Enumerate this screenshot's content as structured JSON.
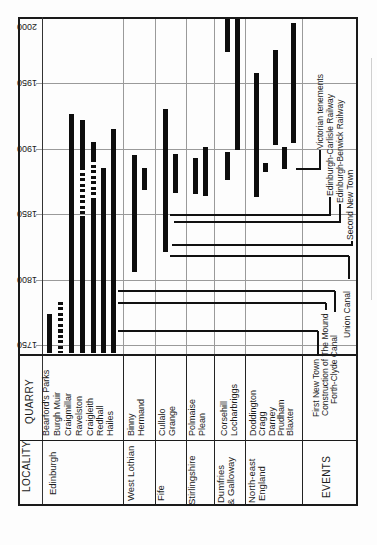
{
  "table": {
    "quarry_header": "QUARRY",
    "locality_header": "LOCALITY"
  },
  "chart_data": {
    "type": "gantt-timeline",
    "title": "",
    "orientation": "figure printed rotated 90 deg: time axis vertical, 1750 at bottom to 2000 at top; year labels appear upside down; category labels read bottom-to-top",
    "time_axis": {
      "unit": "year",
      "ticks": [
        2000,
        1950,
        1900,
        1850,
        1800,
        1750
      ],
      "range": [
        1744,
        2000
      ]
    },
    "colors": {
      "bar": "#0d0d0d",
      "grid": "#9a9a9a",
      "frame": "#1a1a1a",
      "event_line": "#111111"
    },
    "layout": {
      "frame": {
        "left": 18,
        "top": 17,
        "right": 356,
        "plot_bottom": 345,
        "table_top": 354,
        "row_divider": 440,
        "table_bottom": 504
      },
      "axis_col_x": 42,
      "scale": {
        "y_at_1750": 345,
        "base_year": 1750,
        "px_per_year": 1.31
      },
      "quarry_label_anchor_y": 436,
      "locality_label_anchor_y": 501
    },
    "groups": [
      {
        "locality": "Edinburgh",
        "divider_x": 123,
        "label_lines": [
          {
            "text": "Edinburgh",
            "x": 53,
            "top": 495
          }
        ],
        "quarries": [
          {
            "name": "Bearford's Parks",
            "x": 49,
            "segments": [
              {
                "start": 1744,
                "end": 1774,
                "style": "solid"
              }
            ]
          },
          {
            "name": "Burgh Muir",
            "x": 60,
            "segments": [
              {
                "start": 1744,
                "end": 1783,
                "style": "dashed"
              }
            ]
          },
          {
            "name": "Craigmillar",
            "x": 71,
            "segments": [
              {
                "start": 1744,
                "end": 1926,
                "style": "solid"
              }
            ]
          },
          {
            "name": "Ravelston",
            "x": 82,
            "segments": [
              {
                "start": 1744,
                "end": 1846,
                "style": "solid"
              },
              {
                "start": 1846,
                "end": 1886,
                "style": "dashed"
              },
              {
                "start": 1886,
                "end": 1922,
                "style": "solid"
              }
            ]
          },
          {
            "name": "Craigleith",
            "x": 93,
            "segments": [
              {
                "start": 1744,
                "end": 1861,
                "style": "solid"
              },
              {
                "start": 1861,
                "end": 1892,
                "style": "dashed"
              },
              {
                "start": 1892,
                "end": 1905,
                "style": "solid"
              }
            ]
          },
          {
            "name": "Redhall",
            "x": 103,
            "segments": [
              {
                "start": 1744,
                "end": 1885,
                "style": "solid"
              }
            ]
          },
          {
            "name": "Hailes",
            "x": 113,
            "segments": [
              {
                "start": 1744,
                "end": 1915,
                "style": "solid"
              }
            ]
          }
        ]
      },
      {
        "locality": "West Lothian",
        "divider_x": 155,
        "label_lines": [
          {
            "text": "West Lothian",
            "x": 131,
            "top": 501
          }
        ],
        "quarries": [
          {
            "name": "Binny",
            "x": 134,
            "segments": [
              {
                "start": 1806,
                "end": 1895,
                "style": "solid"
              }
            ]
          },
          {
            "name": "Hermand",
            "x": 144,
            "segments": [
              {
                "start": 1868,
                "end": 1885,
                "style": "solid"
              }
            ]
          }
        ]
      },
      {
        "locality": "Fife",
        "divider_x": 186,
        "label_lines": [
          {
            "text": "Fife",
            "x": 161,
            "top": 501
          }
        ],
        "quarries": [
          {
            "name": "Cullalo",
            "x": 165,
            "segments": [
              {
                "start": 1821,
                "end": 1930,
                "style": "solid"
              }
            ]
          },
          {
            "name": "Grange",
            "x": 175,
            "segments": [
              {
                "start": 1866,
                "end": 1896,
                "style": "solid"
              }
            ]
          }
        ]
      },
      {
        "locality": "Stirlingshire",
        "divider_x": 214,
        "label_lines": [
          {
            "text": "Stirlingshire",
            "x": 192,
            "top": 505
          }
        ],
        "quarries": [
          {
            "name": "Polmaise",
            "x": 195,
            "segments": [
              {
                "start": 1865,
                "end": 1893,
                "style": "solid"
              }
            ]
          },
          {
            "name": "Plean",
            "x": 205,
            "segments": [
              {
                "start": 1864,
                "end": 1901,
                "style": "solid"
              }
            ]
          }
        ]
      },
      {
        "locality": "Dumfries & Galloway",
        "divider_x": 245,
        "label_lines": [
          {
            "text": "Dumfries",
            "x": 221,
            "top": 503
          },
          {
            "text": "& Galloway",
            "x": 231,
            "top": 505
          }
        ],
        "quarries": [
          {
            "name": "Corsehill",
            "x": 227,
            "segments": [
              {
                "start": 1876,
                "end": 1897,
                "style": "solid"
              },
              {
                "start": 1974,
                "end": 1999,
                "style": "solid"
              }
            ]
          },
          {
            "name": "Locharbriggs",
            "x": 237,
            "segments": [
              {
                "start": 1899,
                "end": 1999,
                "style": "solid"
              }
            ]
          }
        ]
      },
      {
        "locality": "North-east England",
        "divider_x": 302,
        "label_lines": [
          {
            "text": "North-east",
            "x": 252,
            "top": 503
          },
          {
            "text": "England",
            "x": 262,
            "top": 501
          }
        ],
        "quarries": [
          {
            "name": "Doddington",
            "x": 256,
            "segments": [
              {
                "start": 1863,
                "end": 1958,
                "style": "solid"
              }
            ]
          },
          {
            "name": "Cragg",
            "x": 265,
            "segments": [
              {
                "start": 1882,
                "end": 1889,
                "style": "solid"
              }
            ]
          },
          {
            "name": "Darney",
            "x": 275,
            "segments": [
              {
                "start": 1903,
                "end": 1975,
                "style": "solid"
              }
            ]
          },
          {
            "name": "Prudham",
            "x": 284,
            "segments": [
              {
                "start": 1884,
                "end": 1901,
                "style": "solid"
              }
            ]
          },
          {
            "name": "Blaxter",
            "x": 293,
            "segments": [
              {
                "start": 1904,
                "end": 1996,
                "style": "solid"
              }
            ]
          }
        ]
      }
    ],
    "events": {
      "header": "EVENTS",
      "items": [
        {
          "name": "First New Town",
          "year": 1761,
          "line": {
            "x1": 118,
            "x2": 318
          },
          "stub": {
            "x": 317,
            "y1": 331,
            "y2": 356
          },
          "label": {
            "x": 317,
            "top": 417
          }
        },
        {
          "name": "Construction of The Mound",
          "year": 1782,
          "line": {
            "x1": 118,
            "x2": 326
          },
          "stub": {
            "x": 325,
            "y1": 303,
            "y2": 310
          },
          "label": {
            "x": 326,
            "top": 416
          }
        },
        {
          "name": "Forth-Clyde Canal",
          "year": 1791,
          "line": {
            "x1": 118,
            "x2": 335
          },
          "stub": {
            "x": 334,
            "y1": 291,
            "y2": 312
          },
          "label": {
            "x": 335,
            "top": 404
          }
        },
        {
          "name": "Union Canal",
          "year": 1818,
          "line": {
            "x1": 170,
            "x2": 349
          },
          "stub": {
            "x": 348,
            "y1": 256,
            "y2": 279
          },
          "label": {
            "x": 348,
            "top": 338
          }
        },
        {
          "name": "Second New Town",
          "year": 1826,
          "line": {
            "x1": 172,
            "x2": 352
          },
          "stub": {
            "x": 351,
            "y1": 241,
            "y2": 246
          },
          "label": {
            "x": 351,
            "top": 240
          }
        },
        {
          "name": "Edinburgh-Berwick Railway",
          "year": 1844,
          "line": {
            "x1": 174,
            "x2": 340
          },
          "stub": {
            "x": 339,
            "y1": 204,
            "y2": 223
          },
          "label": {
            "x": 341,
            "top": 203
          }
        },
        {
          "name": "Edinburgh-Carlisle Railway",
          "year": 1849,
          "line": {
            "x1": 170,
            "x2": 330
          },
          "stub": {
            "x": 329,
            "y1": 197,
            "y2": 216
          },
          "label": {
            "x": 331,
            "top": 196
          }
        },
        {
          "name": "Victorian tenements",
          "year": 1884,
          "line": {
            "x1": 296,
            "x2": 321
          },
          "stub": {
            "x": 319,
            "y1": 150,
            "y2": 170
          },
          "label": {
            "x": 321,
            "top": 149
          }
        }
      ]
    }
  }
}
